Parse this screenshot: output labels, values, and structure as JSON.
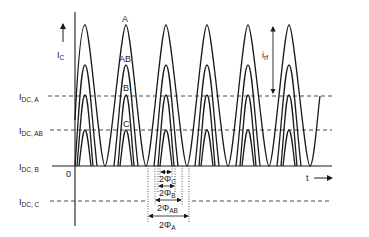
{
  "figure": {
    "y_axis_label": "I",
    "y_axis_label_sub": "C",
    "x_axis_label": "t",
    "origin_label": "0",
    "curve_labels": [
      "A",
      "AB",
      "B",
      "C"
    ],
    "ripple_label": "i",
    "ripple_label_sub": "rf",
    "dc_levels": [
      {
        "main": "I",
        "sub": "DC, A"
      },
      {
        "main": "I",
        "sub": "DC, AB"
      },
      {
        "main": "I",
        "sub": "DC, B"
      },
      {
        "main": "I",
        "sub": "DC, C"
      }
    ],
    "conduction_angles": [
      {
        "main": "2Φ",
        "sub": "C"
      },
      {
        "main": "2Φ",
        "sub": "B"
      },
      {
        "main": "2Φ",
        "sub": "AB"
      },
      {
        "main": "2Φ",
        "sub": "A"
      }
    ]
  },
  "colors": {
    "line": "#1a1a1a",
    "background": "#ffffff"
  }
}
